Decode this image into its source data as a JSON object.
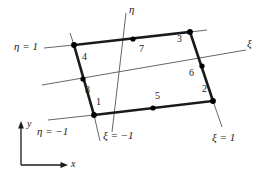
{
  "figure": {
    "stroke_color": "#1a1a1a",
    "thin_stroke_color": "#555555",
    "node_fill": "#000000"
  },
  "element": {
    "corner_nodes": [
      {
        "id": "1",
        "x": 94,
        "y": 115,
        "label": "1",
        "label_x": 96,
        "label_y": 97
      },
      {
        "id": "2",
        "x": 213,
        "y": 101,
        "label": "2",
        "label_x": 202,
        "label_y": 84
      },
      {
        "id": "3",
        "x": 190,
        "y": 32,
        "label": "3",
        "label_x": 177,
        "label_y": 34
      },
      {
        "id": "4",
        "x": 74,
        "y": 45,
        "label": "4",
        "label_x": 82,
        "label_y": 52
      }
    ],
    "midside_nodes": [
      {
        "id": "5",
        "x": 153,
        "y": 108,
        "label": "5",
        "label_x": 155,
        "label_y": 91
      },
      {
        "id": "6",
        "x": 202,
        "y": 66,
        "label": "6",
        "label_x": 189,
        "label_y": 68
      },
      {
        "id": "7",
        "x": 133,
        "y": 39,
        "label": "7",
        "label_x": 139,
        "label_y": 44
      },
      {
        "id": "8",
        "x": 83,
        "y": 79,
        "label": "8",
        "label_x": 85,
        "label_y": 85
      }
    ]
  },
  "natural_axes": {
    "xi": {
      "label": "ξ",
      "label_x": 247,
      "label_y": 40,
      "start_x": 42,
      "start_y": 85,
      "end_x": 246,
      "end_y": 50
    },
    "eta": {
      "label": "η",
      "label_x": 129,
      "label_y": 5,
      "start_x": 112,
      "start_y": 132,
      "end_x": 126,
      "end_y": 13
    }
  },
  "isoparametric_lines": [
    {
      "name": "eta-equals-one",
      "label": "η = 1",
      "label_x": 14,
      "label_y": 41
    },
    {
      "name": "eta-equals-minus-one",
      "label": "η = −1",
      "label_x": 37,
      "label_y": 126
    },
    {
      "name": "xi-equals-minus-one",
      "label": "ξ = −1",
      "label_x": 103,
      "label_y": 130
    },
    {
      "name": "xi-equals-one",
      "label": "ξ = 1",
      "label_x": 212,
      "label_y": 132
    }
  ],
  "global_axes": {
    "x_label": "x",
    "y_label": "y",
    "x_label_x": 71,
    "x_label_y": 163,
    "y_label_x": 29,
    "y_label_y": 122,
    "origin_x": 21,
    "origin_y": 165,
    "x_end": 66,
    "y_end": 123
  }
}
